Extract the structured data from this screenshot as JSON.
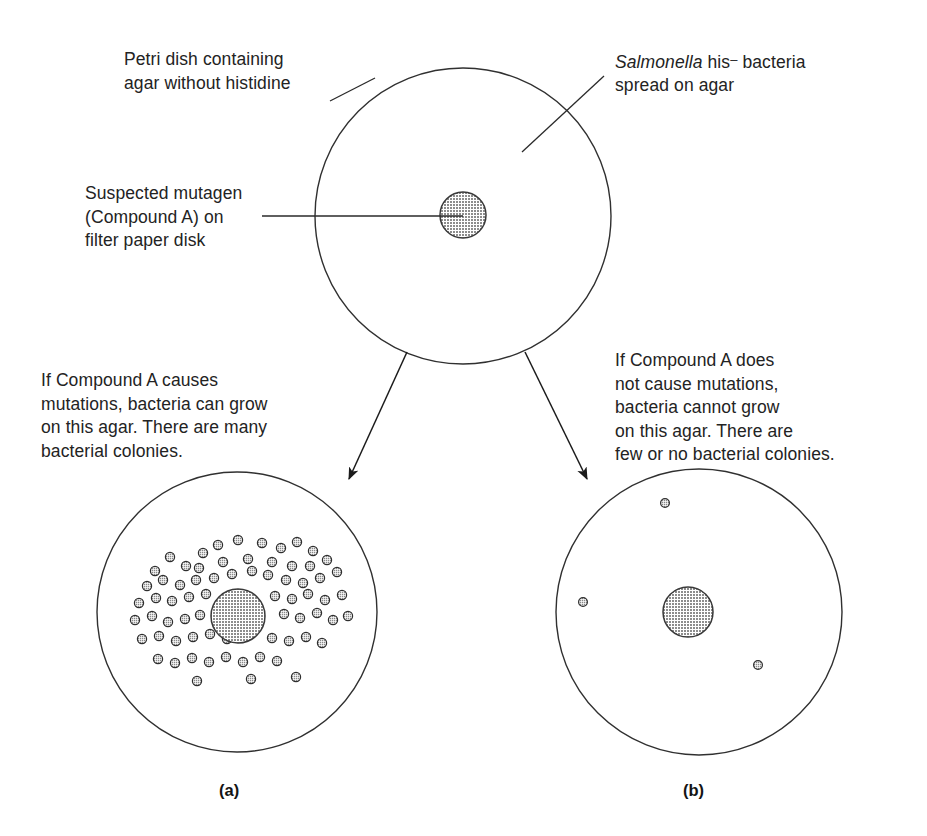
{
  "figure": {
    "background_color": "#ffffff",
    "ink_color": "#1b1b1b",
    "fill_gray": "#b4b4b4"
  },
  "labels": {
    "petri_dish": "Petri dish containing\nagar without histidine",
    "salmonella_prefix": "Salmonella",
    "salmonella_rest": " his",
    "salmonella_minus": "–",
    "salmonella_tail": " bacteria\nspread on agar",
    "mutagen": "Suspected mutagen\n(Compound A) on\nfilter paper disk",
    "result_left": "If Compound A causes\nmutations, bacteria can grow\non this agar. There are many\nbacterial colonies.",
    "result_right": "If Compound A does\nnot cause mutations,\nbacteria cannot grow\non this agar. There are\nfew or no bacterial colonies.",
    "panel_a": "(a)",
    "panel_b": "(b)"
  },
  "diagram_data": {
    "type": "diagram",
    "dishes": [
      {
        "id": "top-dish",
        "role": "initial-plate",
        "cx": 463,
        "cy": 216,
        "r": 148,
        "filter_disk": {
          "cx": 463,
          "cy": 215,
          "r": 23
        },
        "colony_count": 0,
        "colonies": []
      },
      {
        "id": "left-dish",
        "role": "mutagenic-result",
        "cx": 237,
        "cy": 612,
        "r": 140,
        "filter_disk": {
          "cx": 238,
          "cy": 616,
          "r": 27
        },
        "colony_count": 71,
        "colonies": [
          [
            203,
            553
          ],
          [
            218,
            545
          ],
          [
            238,
            540
          ],
          [
            262,
            543
          ],
          [
            281,
            548
          ],
          [
            297,
            542
          ],
          [
            313,
            551
          ],
          [
            170,
            557
          ],
          [
            186,
            566
          ],
          [
            155,
            571
          ],
          [
            199,
            568
          ],
          [
            223,
            562
          ],
          [
            248,
            559
          ],
          [
            272,
            562
          ],
          [
            292,
            566
          ],
          [
            310,
            566
          ],
          [
            327,
            560
          ],
          [
            147,
            586
          ],
          [
            163,
            580
          ],
          [
            180,
            585
          ],
          [
            196,
            580
          ],
          [
            214,
            578
          ],
          [
            232,
            574
          ],
          [
            252,
            571
          ],
          [
            268,
            575
          ],
          [
            286,
            580
          ],
          [
            303,
            583
          ],
          [
            320,
            578
          ],
          [
            337,
            572
          ],
          [
            139,
            603
          ],
          [
            156,
            598
          ],
          [
            172,
            601
          ],
          [
            189,
            597
          ],
          [
            206,
            594
          ],
          [
            275,
            596
          ],
          [
            292,
            599
          ],
          [
            308,
            594
          ],
          [
            325,
            600
          ],
          [
            342,
            595
          ],
          [
            135,
            620
          ],
          [
            152,
            616
          ],
          [
            168,
            622
          ],
          [
            185,
            619
          ],
          [
            200,
            615
          ],
          [
            284,
            614
          ],
          [
            300,
            618
          ],
          [
            317,
            613
          ],
          [
            333,
            620
          ],
          [
            348,
            616
          ],
          [
            142,
            639
          ],
          [
            159,
            636
          ],
          [
            176,
            641
          ],
          [
            193,
            637
          ],
          [
            210,
            634
          ],
          [
            227,
            639
          ],
          [
            272,
            638
          ],
          [
            289,
            641
          ],
          [
            306,
            637
          ],
          [
            322,
            643
          ],
          [
            158,
            659
          ],
          [
            175,
            663
          ],
          [
            192,
            658
          ],
          [
            209,
            662
          ],
          [
            226,
            657
          ],
          [
            243,
            662
          ],
          [
            260,
            657
          ],
          [
            277,
            661
          ],
          [
            197,
            681
          ],
          [
            251,
            679
          ],
          [
            296,
            677
          ]
        ]
      },
      {
        "id": "right-dish",
        "role": "non-mutagenic-result",
        "cx": 699,
        "cy": 612,
        "r": 143,
        "filter_disk": {
          "cx": 688,
          "cy": 612,
          "r": 25
        },
        "colony_count": 3,
        "colonies": [
          [
            665,
            503
          ],
          [
            583,
            602
          ],
          [
            758,
            665
          ]
        ]
      }
    ],
    "arrows": [
      {
        "id": "arrow-left",
        "from": [
          407,
          352
        ],
        "to": [
          347,
          484
        ]
      },
      {
        "id": "arrow-right",
        "from": [
          525,
          352
        ],
        "to": [
          589,
          484
        ]
      }
    ],
    "leader_lines": [
      {
        "id": "leader-petri",
        "points": [
          [
            330,
            101
          ],
          [
            375,
            78
          ]
        ]
      },
      {
        "id": "leader-salmonella",
        "points": [
          [
            604,
            76
          ],
          [
            522,
            152
          ]
        ]
      },
      {
        "id": "leader-mutagen",
        "points": [
          [
            262,
            216
          ],
          [
            463,
            216
          ]
        ]
      }
    ]
  }
}
